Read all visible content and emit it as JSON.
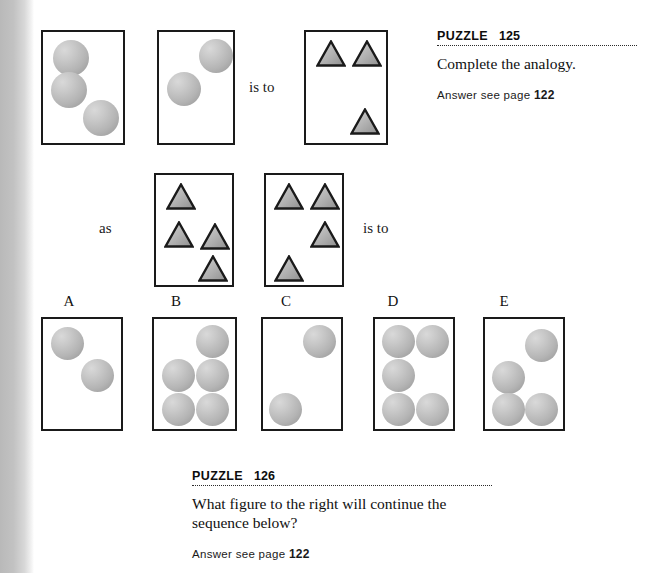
{
  "page": {
    "width": 652,
    "height": 573,
    "background": "#ffffff",
    "binding_shadow_color": "#b9b9b9"
  },
  "relations": {
    "is_to_top": "is to",
    "as": "as",
    "is_to_middle": "is to"
  },
  "puzzles": [
    {
      "label": "PUZZLE",
      "number": "125",
      "question": "Complete the analogy.",
      "answer_prefix": "Answer see page",
      "answer_page": "122"
    },
    {
      "label": "PUZZLE",
      "number": "126",
      "question_line1": "What figure to the right will continue the",
      "question_line2": "sequence below?",
      "answer_prefix": "Answer see page",
      "answer_page": "122"
    }
  ],
  "option_labels": [
    "A",
    "B",
    "C",
    "D",
    "E"
  ],
  "colors": {
    "outline": "#1a1a1a",
    "sphere_light": "#d9d9d9",
    "sphere_dark": "#959595",
    "triangle_light": "#d5d5d5",
    "triangle_dark": "#8f8f8f",
    "text": "#101010"
  },
  "figures": {
    "analogy_top": [
      {
        "name": "analogy-box-1",
        "box": {
          "x": 41,
          "y": 30,
          "w": 84,
          "h": 115
        },
        "shape_type": "circle",
        "count": 3,
        "shapes": [
          {
            "x": 10,
            "y": 8,
            "d": 36
          },
          {
            "x": 8,
            "y": 40,
            "d": 36
          },
          {
            "x": 40,
            "y": 68,
            "d": 36
          }
        ]
      },
      {
        "name": "analogy-box-2",
        "box": {
          "x": 157,
          "y": 30,
          "w": 78,
          "h": 115
        },
        "shape_type": "circle",
        "count": 2,
        "shapes": [
          {
            "x": 40,
            "y": 7,
            "d": 34
          },
          {
            "x": 8,
            "y": 40,
            "d": 34
          }
        ]
      },
      {
        "name": "analogy-box-3",
        "box": {
          "x": 304,
          "y": 30,
          "w": 84,
          "h": 115
        },
        "shape_type": "triangle",
        "count": 3,
        "shapes": [
          {
            "x": 10,
            "y": 8,
            "w": 30,
            "h": 27
          },
          {
            "x": 46,
            "y": 8,
            "w": 30,
            "h": 27
          },
          {
            "x": 44,
            "y": 76,
            "w": 30,
            "h": 27
          }
        ]
      }
    ],
    "analogy_middle": [
      {
        "name": "analogy-box-4",
        "box": {
          "x": 154,
          "y": 173,
          "w": 80,
          "h": 114
        },
        "shape_type": "triangle",
        "count": 4,
        "shapes": [
          {
            "x": 10,
            "y": 8,
            "w": 30,
            "h": 27
          },
          {
            "x": 8,
            "y": 46,
            "w": 30,
            "h": 27
          },
          {
            "x": 44,
            "y": 48,
            "w": 30,
            "h": 27
          },
          {
            "x": 42,
            "y": 80,
            "w": 30,
            "h": 27
          }
        ]
      },
      {
        "name": "analogy-box-5",
        "box": {
          "x": 264,
          "y": 173,
          "w": 80,
          "h": 114
        },
        "shape_type": "triangle",
        "count": 4,
        "shapes": [
          {
            "x": 8,
            "y": 8,
            "w": 30,
            "h": 27
          },
          {
            "x": 44,
            "y": 8,
            "w": 30,
            "h": 27
          },
          {
            "x": 44,
            "y": 46,
            "w": 30,
            "h": 27
          },
          {
            "x": 8,
            "y": 80,
            "w": 30,
            "h": 27
          }
        ]
      }
    ],
    "options": [
      {
        "name": "option-box-a",
        "label": "A",
        "label_x": 69,
        "box": {
          "x": 41,
          "y": 317,
          "w": 82,
          "h": 114
        },
        "shape_type": "circle",
        "count": 2,
        "shapes": [
          {
            "x": 8,
            "y": 8,
            "d": 33
          },
          {
            "x": 38,
            "y": 40,
            "d": 33
          }
        ]
      },
      {
        "name": "option-box-b",
        "label": "B",
        "label_x": 176,
        "box": {
          "x": 152,
          "y": 317,
          "w": 85,
          "h": 114
        },
        "shape_type": "circle",
        "count": 5,
        "shapes": [
          {
            "x": 42,
            "y": 6,
            "d": 33
          },
          {
            "x": 8,
            "y": 40,
            "d": 33
          },
          {
            "x": 42,
            "y": 40,
            "d": 33
          },
          {
            "x": 8,
            "y": 74,
            "d": 33
          },
          {
            "x": 42,
            "y": 74,
            "d": 33
          }
        ]
      },
      {
        "name": "option-box-c",
        "label": "C",
        "label_x": 286,
        "box": {
          "x": 261,
          "y": 317,
          "w": 82,
          "h": 114
        },
        "shape_type": "circle",
        "count": 2,
        "shapes": [
          {
            "x": 40,
            "y": 6,
            "d": 33
          },
          {
            "x": 6,
            "y": 74,
            "d": 33
          }
        ]
      },
      {
        "name": "option-box-d",
        "label": "D",
        "label_x": 393,
        "box": {
          "x": 373,
          "y": 317,
          "w": 82,
          "h": 114
        },
        "shape_type": "circle",
        "count": 5,
        "shapes": [
          {
            "x": 7,
            "y": 6,
            "d": 33
          },
          {
            "x": 41,
            "y": 6,
            "d": 33
          },
          {
            "x": 7,
            "y": 40,
            "d": 33
          },
          {
            "x": 7,
            "y": 74,
            "d": 33
          },
          {
            "x": 41,
            "y": 74,
            "d": 33
          }
        ]
      },
      {
        "name": "option-box-e",
        "label": "E",
        "label_x": 504,
        "box": {
          "x": 483,
          "y": 317,
          "w": 82,
          "h": 114
        },
        "shape_type": "circle",
        "count": 4,
        "shapes": [
          {
            "x": 40,
            "y": 10,
            "d": 33
          },
          {
            "x": 7,
            "y": 42,
            "d": 33
          },
          {
            "x": 7,
            "y": 74,
            "d": 33
          },
          {
            "x": 40,
            "y": 74,
            "d": 33
          }
        ]
      }
    ]
  }
}
